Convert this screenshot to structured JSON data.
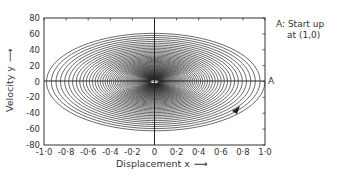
{
  "chart_data": {
    "type": "line",
    "title": "",
    "xlabel": "Displacement x",
    "ylabel": "Velocity y",
    "xlim": [
      -1.0,
      1.0
    ],
    "ylim": [
      -80,
      80
    ],
    "xticks": [
      -1.0,
      -0.8,
      -0.6,
      -0.4,
      -0.2,
      0,
      0.2,
      0.4,
      0.6,
      0.8,
      1.0
    ],
    "xtick_labels": [
      "-1·0",
      "-0·8",
      "-0·6",
      "-0·4",
      "-0·2",
      "0",
      "0·2",
      "0·4",
      "0·6",
      "0·8",
      "1·0"
    ],
    "yticks": [
      80,
      60,
      40,
      20,
      0,
      -20,
      -40,
      -60,
      -80
    ],
    "ytick_labels": [
      "80",
      "60",
      "40",
      "20",
      "0",
      "-20",
      "-40",
      "-60",
      "-80"
    ],
    "grid": false,
    "legend": null,
    "series": [
      {
        "name": "phase-plane trajectory (damped oscillation)",
        "description": "Clockwise decaying spiral from start point (1,0) toward origin",
        "start": [
          1.0,
          0
        ],
        "approx_extents": {
          "x_min": -0.98,
          "x_max": 1.0,
          "y_min": -62,
          "y_max": 62
        },
        "spiral_params": {
          "omega": 62.8,
          "decay_per_turn": 0.955,
          "turns": 70
        }
      }
    ],
    "annotations": [
      {
        "text": "A: Start up",
        "line2": "at (1,0)",
        "position": "top-right, outside plot"
      },
      {
        "text": "A",
        "at": [
          1.0,
          0
        ],
        "position": "right of axis end"
      },
      {
        "type": "arrow",
        "at": [
          0.78,
          -52
        ],
        "direction": "clockwise along trajectory"
      }
    ]
  },
  "labels": {
    "xlabel": "Displacement x",
    "ylabel": "Velocity y",
    "annotation_line1": "A: Start up",
    "annotation_line2": "at (1,0)",
    "point_label": "A"
  }
}
